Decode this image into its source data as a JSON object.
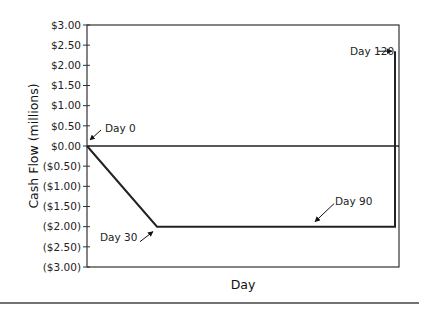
{
  "chart_data": {
    "type": "line",
    "title": "",
    "xlabel": "Day",
    "ylabel": "Cash Flow (millions)",
    "ylim": [
      -3.0,
      3.0
    ],
    "yticks": [
      3.0,
      2.5,
      2.0,
      1.5,
      1.0,
      0.5,
      0.0,
      -0.5,
      -1.0,
      -1.5,
      -2.0,
      -2.5,
      -3.0
    ],
    "ytick_labels": [
      "$3.00",
      "$2.50",
      "$2.00",
      "$1.50",
      "$1.00",
      "$0.50",
      "$0.00",
      "($0.50)",
      "($1.00)",
      "($1.50)",
      "($2.00)",
      "($2.50)",
      "($3.00)"
    ],
    "grid": false,
    "legend": "none",
    "series": [
      {
        "name": "Cash Flow",
        "points": [
          {
            "day": 0,
            "value": 0.0
          },
          {
            "day": 30,
            "value": -2.0
          },
          {
            "day": 90,
            "value": -2.0
          },
          {
            "day": 120,
            "value": -2.0
          },
          {
            "day": 120,
            "value": 2.35
          }
        ]
      }
    ],
    "annotations": [
      {
        "text": "Day 0",
        "day": 0,
        "value": 0.0
      },
      {
        "text": "Day 30",
        "day": 30,
        "value": -2.0
      },
      {
        "text": "Day 90",
        "day": 90,
        "value": -2.0
      },
      {
        "text": "Day 120",
        "day": 120,
        "value": 2.35
      }
    ]
  }
}
